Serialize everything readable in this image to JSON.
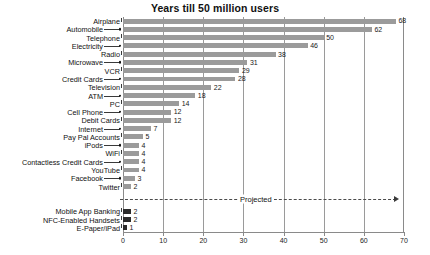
{
  "chart_data": {
    "type": "bar",
    "orientation": "horizontal",
    "title": "Years till 50 million users",
    "xlabel": "",
    "ylabel": "",
    "xlim": [
      0,
      70
    ],
    "xticks": [
      0,
      10,
      20,
      30,
      40,
      50,
      60,
      70
    ],
    "grid": true,
    "gridlines_at": [
      10,
      20,
      30,
      40,
      50,
      60
    ],
    "legend": "none",
    "categories": [
      "Airplane",
      "Automobile",
      "Telephone",
      "Electricity",
      "Radio",
      "Microwave",
      "VCR",
      "Credit Cards",
      "Television",
      "ATM",
      "PC",
      "Cell Phone",
      "Debit Cards",
      "Internet",
      "Pay Pal Accounts",
      "iPods",
      "WiFi",
      "Contactless Credit Cards",
      "YouTube",
      "Facebook",
      "Twitter",
      "Mobile App Banking",
      "NFC-Enabled Handsets",
      "E-Paper/iPad"
    ],
    "values": [
      68,
      62,
      50,
      46,
      38,
      31,
      29,
      28,
      22,
      18,
      14,
      12,
      12,
      7,
      5,
      4,
      4,
      4,
      4,
      3,
      2,
      2,
      2,
      1
    ],
    "value_labels": [
      "68",
      "62",
      "50",
      "46",
      "38",
      "31",
      "29",
      "28",
      "22",
      "18",
      "14",
      "12",
      "12",
      "7",
      "5",
      "4",
      "4",
      "4",
      "4",
      "3",
      "2",
      "2",
      "2",
      "1"
    ],
    "series_groups": [
      {
        "name": "Actual",
        "color": "#9b9b9b",
        "from_index": 0,
        "to_index": 20
      },
      {
        "name": "Projected",
        "color": "#2b2b2b",
        "from_index": 21,
        "to_index": 23
      }
    ],
    "annotations": [
      {
        "name": "projected-divider",
        "text": "Projected",
        "type": "dashed-arrow-line"
      }
    ]
  },
  "axis": {
    "tick_labels": [
      "0",
      "10",
      "20",
      "30",
      "40",
      "50",
      "60",
      "70"
    ]
  },
  "annotation": {
    "projected_text": "Projected"
  }
}
